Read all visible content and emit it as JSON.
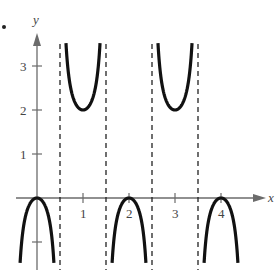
{
  "chart_data": {
    "type": "line",
    "title": "",
    "xlabel": "x",
    "ylabel": "y",
    "function": "y = 1 - sec(pi x)",
    "x_ticks": [
      1,
      2,
      3,
      4
    ],
    "y_ticks": [
      -1,
      1,
      2,
      3
    ],
    "x_tick_labels": [
      "1",
      "2",
      "3",
      "4"
    ],
    "y_tick_labels": [
      "1",
      "2",
      "3"
    ],
    "xlim": [
      -0.4,
      4.8
    ],
    "ylim": [
      -1.8,
      3.7
    ],
    "vertical_asymptotes": [
      0.5,
      1.5,
      2.5,
      3.5
    ],
    "local_maxima": [
      [
        0,
        0
      ],
      [
        2,
        0
      ],
      [
        4,
        0
      ]
    ],
    "local_minima": [
      [
        1,
        2
      ],
      [
        3,
        2
      ]
    ],
    "grid": false,
    "series": [
      {
        "name": "y = 1 - sec(pi x)",
        "style": "solid thick black"
      }
    ]
  },
  "labels": {
    "x_axis": "x",
    "y_axis": "y",
    "bullet": "•"
  },
  "colors": {
    "curve": "#111111",
    "axis": "#6b6b6b",
    "asymptote": "#222222"
  }
}
